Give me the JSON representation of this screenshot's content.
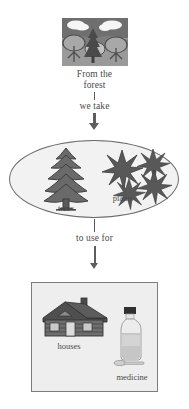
{
  "diagram": {
    "title_flow": "From the forest we take trees and plants to use for houses and medicine",
    "source_scene": {
      "icon": "forest-scene-icon",
      "caption": "From the\nforest"
    },
    "connector_1": {
      "label": "we take"
    },
    "group_oval": {
      "items": [
        {
          "icon": "pine-tree-icon",
          "label": "trees"
        },
        {
          "icon": "plant-leaves-icon",
          "label": "plants"
        }
      ]
    },
    "connector_2": {
      "label": "to use for"
    },
    "result_box": {
      "items": [
        {
          "icon": "log-house-icon",
          "label": "houses"
        },
        {
          "icon": "medicine-bottle-icon",
          "label": "medicine"
        }
      ]
    }
  },
  "colors": {
    "ink": "#4a4a4a",
    "outline": "#6b6b6b",
    "fill_light": "#f2f2f2",
    "fill_box": "#eeeeee",
    "arrow": "#5d5d5d",
    "tree_dark": "#5e5e5e",
    "scene_sky": "#6f6f6f",
    "scene_ground": "#9a9a9a"
  }
}
